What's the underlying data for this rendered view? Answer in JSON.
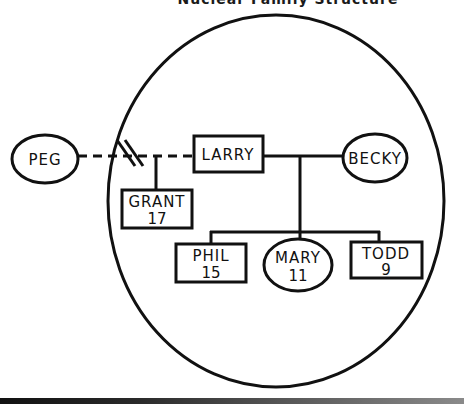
{
  "diagram": {
    "title": "Nuclear Family Structure",
    "type": "genogram",
    "colors": {
      "stroke": "#111111",
      "background": "#ffffff"
    },
    "household_boundary": {
      "shape": "ellipse",
      "description": "circle enclosing the current household"
    },
    "people": [
      {
        "id": "peg",
        "name": "PEG",
        "age": "",
        "shape": "ellipse",
        "sex": "female",
        "in_household": false
      },
      {
        "id": "larry",
        "name": "LARRY",
        "age": "",
        "shape": "rectangle",
        "sex": "male",
        "in_household": true
      },
      {
        "id": "becky",
        "name": "BECKY",
        "age": "",
        "shape": "ellipse",
        "sex": "female",
        "in_household": true
      },
      {
        "id": "grant",
        "name": "GRANT",
        "age": "17",
        "shape": "rectangle",
        "sex": "male",
        "in_household": true
      },
      {
        "id": "phil",
        "name": "PHIL",
        "age": "15",
        "shape": "rectangle",
        "sex": "male",
        "in_household": true
      },
      {
        "id": "mary",
        "name": "MARY",
        "age": "11",
        "shape": "ellipse",
        "sex": "female",
        "in_household": true
      },
      {
        "id": "todd",
        "name": "TODD",
        "age": "9",
        "shape": "rectangle",
        "sex": "male",
        "in_household": true
      }
    ],
    "relationships": [
      {
        "from": "peg",
        "to": "larry",
        "type": "divorced",
        "line": "dashed",
        "marker": "double-slash"
      },
      {
        "from": "larry",
        "to": "becky",
        "type": "married",
        "line": "solid"
      },
      {
        "parents": [
          "peg",
          "larry"
        ],
        "children": [
          "grant"
        ]
      },
      {
        "parents": [
          "larry",
          "becky"
        ],
        "children": [
          "phil",
          "mary",
          "todd"
        ]
      }
    ]
  }
}
